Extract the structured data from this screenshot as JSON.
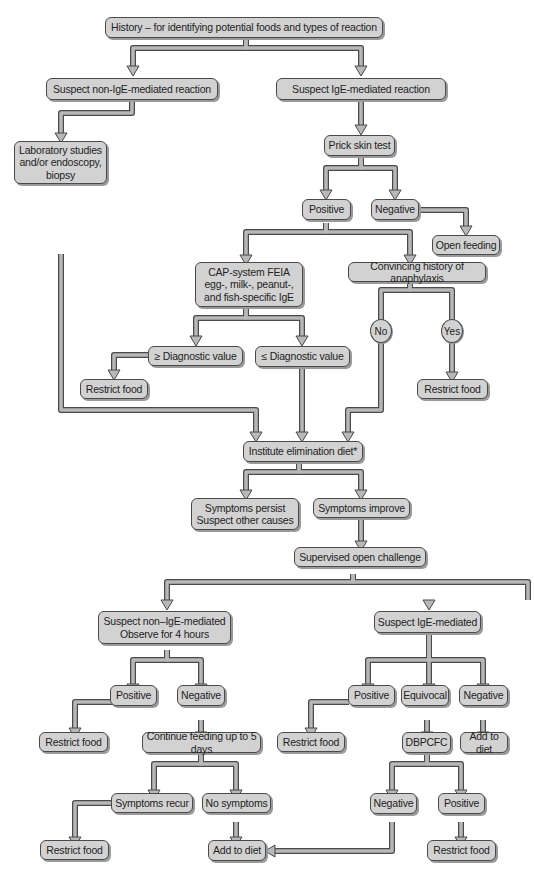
{
  "diagram": {
    "colors": {
      "box_fill": "#d2d2d2",
      "box_border": "#4a4a4a",
      "connector_fill": "#b8b8b8",
      "background": "#ffffff"
    },
    "nodes": {
      "history": "History – for identifying potential foods and types of reaction",
      "suspect_non_ige": "Suspect non-IgE-mediated reaction",
      "suspect_ige": "Suspect IgE-mediated reaction",
      "lab_studies": "Laboratory studies\nand/or endoscopy,\nbiopsy",
      "prick_skin_test": "Prick skin test",
      "positive_1": "Positive",
      "negative_1": "Negative",
      "open_feeding": "Open feeding",
      "cap_system": "CAP-system FEIA\negg-, milk-, peanut-,\nand fish-specific IgE",
      "convincing_history": "Convincing history of anaphylaxis",
      "ge_diagnostic": "≥ Diagnostic value",
      "le_diagnostic": "≤ Diagnostic value",
      "no": "No",
      "yes": "Yes",
      "restrict_food_1": "Restrict food",
      "restrict_food_2": "Restrict food",
      "elimination_diet": "Institute elimination diet*",
      "symptoms_persist": "Symptoms persist\nSuspect other causes",
      "symptoms_improve": "Symptoms improve",
      "supervised_challenge": "Supervised open challenge",
      "suspect_non_ige_observe": "Suspect non–IgE-mediated\nObserve for 4 hours",
      "suspect_ige_mediated": "Suspect IgE-mediated",
      "positive_2": "Positive",
      "negative_2": "Negative",
      "positive_3": "Positive",
      "equivocal": "Equivocal",
      "negative_3": "Negative",
      "restrict_food_3": "Restrict food",
      "continue_feeding": "Continue feeding up to 5 days",
      "restrict_food_4": "Restrict food",
      "dbpcfc": "DBPCFC",
      "add_to_diet_1": "Add to diet",
      "symptoms_recur": "Symptoms recur",
      "no_symptoms": "No symptoms",
      "negative_4": "Negative",
      "positive_4": "Positive",
      "restrict_food_5": "Restrict food",
      "add_to_diet_2": "Add to diet",
      "restrict_food_6": "Restrict food"
    }
  }
}
